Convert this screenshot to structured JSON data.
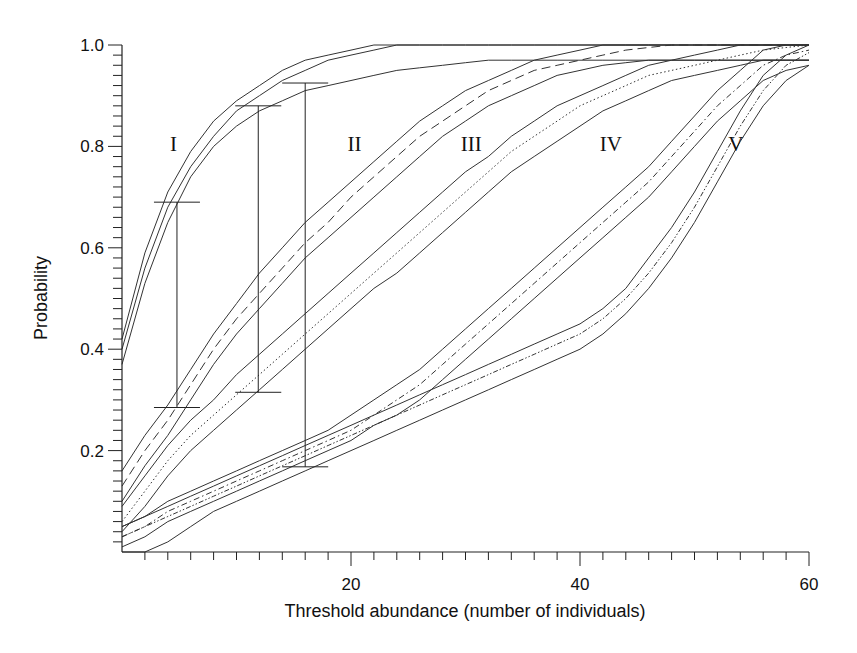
{
  "chart_data": {
    "type": "line",
    "title": "",
    "xlabel": "Threshold abundance (number of individuals)",
    "ylabel": "Probability",
    "xlim": [
      0,
      60
    ],
    "ylim": [
      0,
      1.0
    ],
    "x_ticks": [
      20,
      40,
      60
    ],
    "x_tick_labels": [
      "20",
      "40",
      "60"
    ],
    "y_ticks": [
      0.2,
      0.4,
      0.6,
      0.8,
      1.0
    ],
    "y_tick_labels": [
      "0.2",
      "0.4",
      "0.6",
      "0.8",
      "1.0"
    ],
    "grid": false,
    "legend": "none; curves labelled inline with Roman numerals",
    "annotations": [
      "I",
      "II",
      "III",
      "IV",
      "V"
    ],
    "x": [
      0,
      2,
      4,
      6,
      8,
      10,
      12,
      14,
      16,
      18,
      20,
      22,
      24,
      26,
      28,
      30,
      32,
      34,
      36,
      38,
      40,
      42,
      44,
      46,
      48,
      50,
      52,
      54,
      56,
      58,
      60
    ],
    "series": [
      {
        "name": "I",
        "style": "solid",
        "values": [
          0.4,
          0.56,
          0.68,
          0.76,
          0.82,
          0.87,
          0.9,
          0.93,
          0.95,
          0.97,
          0.98,
          0.99,
          1.0,
          1.0,
          1.0,
          1.0,
          1.0,
          1.0,
          1.0,
          1.0,
          1.0,
          1.0,
          1.0,
          1.0,
          1.0,
          1.0,
          1.0,
          1.0,
          1.0,
          1.0,
          1.0
        ],
        "upper": [
          0.42,
          0.59,
          0.71,
          0.79,
          0.85,
          0.89,
          0.92,
          0.95,
          0.97,
          0.98,
          0.99,
          1.0,
          1.0,
          1.0,
          1.0,
          1.0,
          1.0,
          1.0,
          1.0,
          1.0,
          1.0,
          1.0,
          1.0,
          1.0,
          1.0,
          1.0,
          1.0,
          1.0,
          1.0,
          1.0,
          1.0
        ],
        "lower": [
          0.37,
          0.53,
          0.65,
          0.74,
          0.8,
          0.84,
          0.87,
          0.89,
          0.91,
          0.92,
          0.93,
          0.94,
          0.95,
          0.955,
          0.96,
          0.965,
          0.97,
          0.97,
          0.97,
          0.97,
          0.97,
          0.97,
          0.97,
          0.97,
          0.97,
          0.97,
          0.97,
          0.97,
          0.97,
          0.97,
          0.97
        ]
      },
      {
        "name": "II",
        "style": "dashed",
        "values": [
          0.13,
          0.2,
          0.26,
          0.33,
          0.4,
          0.46,
          0.51,
          0.56,
          0.61,
          0.65,
          0.7,
          0.74,
          0.78,
          0.82,
          0.85,
          0.88,
          0.91,
          0.93,
          0.95,
          0.96,
          0.97,
          0.98,
          0.99,
          0.995,
          1.0,
          1.0,
          1.0,
          1.0,
          1.0,
          1.0,
          1.0
        ],
        "upper": [
          0.16,
          0.23,
          0.29,
          0.36,
          0.43,
          0.49,
          0.55,
          0.6,
          0.65,
          0.69,
          0.73,
          0.77,
          0.81,
          0.85,
          0.88,
          0.91,
          0.93,
          0.95,
          0.97,
          0.98,
          0.99,
          1.0,
          1.0,
          1.0,
          1.0,
          1.0,
          1.0,
          1.0,
          1.0,
          1.0,
          1.0
        ],
        "lower": [
          0.1,
          0.17,
          0.23,
          0.3,
          0.37,
          0.43,
          0.48,
          0.53,
          0.58,
          0.62,
          0.66,
          0.7,
          0.74,
          0.78,
          0.82,
          0.85,
          0.88,
          0.9,
          0.92,
          0.94,
          0.95,
          0.96,
          0.965,
          0.97,
          0.97,
          0.97,
          0.97,
          0.97,
          0.97,
          0.97,
          0.97
        ]
      },
      {
        "name": "III",
        "style": "dotted",
        "values": [
          0.06,
          0.12,
          0.18,
          0.23,
          0.27,
          0.31,
          0.35,
          0.39,
          0.43,
          0.47,
          0.51,
          0.55,
          0.59,
          0.63,
          0.67,
          0.71,
          0.75,
          0.79,
          0.82,
          0.85,
          0.88,
          0.9,
          0.92,
          0.94,
          0.95,
          0.96,
          0.97,
          0.98,
          0.99,
          0.995,
          1.0
        ],
        "upper": [
          0.09,
          0.15,
          0.21,
          0.26,
          0.3,
          0.35,
          0.39,
          0.43,
          0.47,
          0.51,
          0.55,
          0.59,
          0.63,
          0.67,
          0.71,
          0.75,
          0.78,
          0.82,
          0.85,
          0.88,
          0.9,
          0.92,
          0.94,
          0.96,
          0.97,
          0.98,
          0.99,
          1.0,
          1.0,
          1.0,
          1.0
        ],
        "lower": [
          0.04,
          0.09,
          0.15,
          0.2,
          0.24,
          0.28,
          0.32,
          0.36,
          0.4,
          0.44,
          0.48,
          0.52,
          0.55,
          0.59,
          0.63,
          0.67,
          0.71,
          0.75,
          0.78,
          0.81,
          0.84,
          0.87,
          0.89,
          0.91,
          0.93,
          0.94,
          0.95,
          0.96,
          0.97,
          0.97,
          0.97
        ]
      },
      {
        "name": "IV",
        "style": "dash-dot",
        "values": [
          0.03,
          0.05,
          0.08,
          0.1,
          0.12,
          0.14,
          0.16,
          0.18,
          0.2,
          0.22,
          0.24,
          0.27,
          0.3,
          0.33,
          0.37,
          0.41,
          0.45,
          0.49,
          0.53,
          0.57,
          0.61,
          0.65,
          0.69,
          0.73,
          0.78,
          0.83,
          0.88,
          0.92,
          0.96,
          0.98,
          0.99
        ],
        "upper": [
          0.05,
          0.07,
          0.1,
          0.12,
          0.14,
          0.16,
          0.18,
          0.2,
          0.22,
          0.24,
          0.27,
          0.3,
          0.33,
          0.36,
          0.4,
          0.44,
          0.48,
          0.52,
          0.56,
          0.6,
          0.64,
          0.68,
          0.72,
          0.76,
          0.81,
          0.86,
          0.91,
          0.95,
          0.99,
          1.0,
          1.0
        ],
        "lower": [
          0.01,
          0.03,
          0.06,
          0.08,
          0.1,
          0.12,
          0.14,
          0.16,
          0.18,
          0.2,
          0.22,
          0.25,
          0.27,
          0.3,
          0.34,
          0.38,
          0.42,
          0.46,
          0.5,
          0.54,
          0.58,
          0.62,
          0.66,
          0.7,
          0.75,
          0.8,
          0.85,
          0.89,
          0.93,
          0.95,
          0.96
        ]
      },
      {
        "name": "V",
        "style": "dash-dot-dot",
        "values": [
          0.03,
          0.05,
          0.07,
          0.09,
          0.11,
          0.13,
          0.15,
          0.17,
          0.19,
          0.21,
          0.23,
          0.25,
          0.27,
          0.29,
          0.31,
          0.33,
          0.35,
          0.37,
          0.39,
          0.41,
          0.43,
          0.46,
          0.5,
          0.55,
          0.61,
          0.68,
          0.76,
          0.84,
          0.91,
          0.96,
          0.985
        ],
        "upper": [
          0.05,
          0.07,
          0.09,
          0.11,
          0.13,
          0.15,
          0.17,
          0.19,
          0.21,
          0.23,
          0.25,
          0.27,
          0.29,
          0.31,
          0.33,
          0.35,
          0.37,
          0.39,
          0.41,
          0.43,
          0.45,
          0.48,
          0.52,
          0.58,
          0.64,
          0.71,
          0.79,
          0.87,
          0.94,
          0.98,
          1.0
        ],
        "lower": [
          0.0,
          0.0,
          0.02,
          0.05,
          0.08,
          0.1,
          0.12,
          0.14,
          0.16,
          0.18,
          0.2,
          0.22,
          0.24,
          0.26,
          0.28,
          0.3,
          0.32,
          0.34,
          0.36,
          0.38,
          0.4,
          0.43,
          0.47,
          0.52,
          0.58,
          0.65,
          0.73,
          0.81,
          0.88,
          0.93,
          0.96
        ]
      }
    ],
    "error_bars": [
      {
        "x": 4.8,
        "top": 0.69,
        "bottom": 0.285
      },
      {
        "x": 11.9,
        "top": 0.88,
        "bottom": 0.315
      },
      {
        "x": 16.0,
        "top": 0.925,
        "bottom": 0.168
      }
    ],
    "label_positions": [
      {
        "text": "I",
        "x": 4.5,
        "y": 0.79
      },
      {
        "text": "II",
        "x": 20.3,
        "y": 0.79
      },
      {
        "text": "III",
        "x": 30.5,
        "y": 0.79
      },
      {
        "text": "IV",
        "x": 42.7,
        "y": 0.79
      },
      {
        "text": "V",
        "x": 53.6,
        "y": 0.79
      }
    ]
  }
}
